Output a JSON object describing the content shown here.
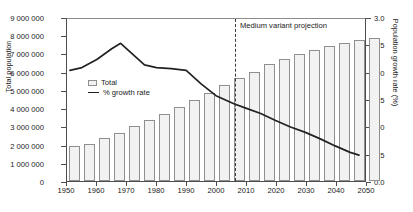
{
  "chart_data": {
    "type": "bar",
    "title": "",
    "subtitle": "",
    "xlabel": "",
    "ylabel": "Total population",
    "y2label": "Population growth rate (%)",
    "xlim": [
      1950,
      2050
    ],
    "ylim": [
      0,
      9000000
    ],
    "y2lim": [
      0.0,
      3.0
    ],
    "grid": false,
    "legend_position": "upper-left-inside",
    "x_ticks": [
      "1950",
      "1960",
      "1970",
      "1980",
      "1990",
      "2000",
      "2010",
      "2020",
      "2030",
      "2040",
      "2050"
    ],
    "x_tick_values": [
      1950,
      1960,
      1970,
      1980,
      1990,
      2000,
      2010,
      2020,
      2030,
      2040,
      2050
    ],
    "y_ticks": [
      "0",
      "1 000 000",
      "2 000 000",
      "3 000 000",
      "4 000 000",
      "5 000 000",
      "6 000 000",
      "7 000 000",
      "8 000 000",
      "9 000 000"
    ],
    "y_tick_values": [
      0,
      1000000,
      2000000,
      3000000,
      4000000,
      5000000,
      6000000,
      7000000,
      8000000,
      9000000
    ],
    "y2_ticks": [
      "0.0",
      "0.5",
      "1.0",
      "1.5",
      "2.0",
      "2.5",
      "3.0"
    ],
    "y2_tick_values": [
      0.0,
      0.5,
      1.0,
      1.5,
      2.0,
      2.5,
      3.0
    ],
    "categories": [
      1950,
      1955,
      1960,
      1965,
      1970,
      1975,
      1980,
      1985,
      1990,
      1995,
      2000,
      2005,
      2010,
      2015,
      2020,
      2025,
      2030,
      2035,
      2040,
      2045,
      2050
    ],
    "series": [
      {
        "name": "Total",
        "axis": "left",
        "type": "bar",
        "values": [
          1900000,
          2050000,
          2350000,
          2650000,
          3000000,
          3330000,
          3700000,
          4080000,
          4450000,
          4850000,
          5250000,
          5650000,
          6000000,
          6400000,
          6700000,
          6950000,
          7200000,
          7400000,
          7600000,
          7750000,
          7850000
        ]
      },
      {
        "name": "% growth rate",
        "axis": "right",
        "type": "line",
        "x": [
          1951,
          1955,
          1960,
          1965,
          1968,
          1972,
          1976,
          1980,
          1985,
          1990,
          1995,
          2000,
          2006,
          2010,
          2015,
          2020,
          2025,
          2030,
          2035,
          2040,
          2045,
          2048
        ],
        "values": [
          2.05,
          2.1,
          2.25,
          2.45,
          2.55,
          2.35,
          2.15,
          2.1,
          2.08,
          2.05,
          1.8,
          1.58,
          1.43,
          1.35,
          1.25,
          1.12,
          1.0,
          0.9,
          0.78,
          0.65,
          0.53,
          0.48
        ]
      }
    ],
    "annotations": [
      {
        "name": "projection-divider",
        "text": "Medium variant projection",
        "x": 2006,
        "style": "vertical-dashed-line"
      }
    ],
    "legend": [
      {
        "label": "Total",
        "marker": "bar-swatch"
      },
      {
        "label": "% growth rate",
        "marker": "line-swatch"
      }
    ],
    "colors": {
      "bar_fill": "#f2f2f2",
      "bar_edge": "#8f8f8f",
      "line": "#222222",
      "axis": "#4d4d4d",
      "text": "#1a1a1a",
      "dash": "#3a3a3a"
    }
  }
}
